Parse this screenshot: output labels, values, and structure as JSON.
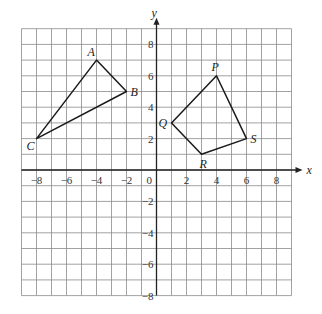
{
  "diagram": {
    "type": "coordinate-grid",
    "axes": {
      "x_label": "x",
      "y_label": "y",
      "x_range": [
        -9,
        9
      ],
      "y_range": [
        -8,
        9
      ],
      "x_ticks": [
        {
          "value": -8,
          "label": "−8"
        },
        {
          "value": -6,
          "label": "−6"
        },
        {
          "value": -4,
          "label": "−4"
        },
        {
          "value": -2,
          "label": "−2"
        },
        {
          "value": 2,
          "label": "2"
        },
        {
          "value": 4,
          "label": "4"
        },
        {
          "value": 6,
          "label": "6"
        },
        {
          "value": 8,
          "label": "8"
        }
      ],
      "y_ticks": [
        {
          "value": 8,
          "label": "8"
        },
        {
          "value": 6,
          "label": "6"
        },
        {
          "value": 4,
          "label": "4"
        },
        {
          "value": 2,
          "label": "2"
        },
        {
          "value": -2,
          "label": "−2"
        },
        {
          "value": -4,
          "label": "−4"
        },
        {
          "value": -6,
          "label": "−6"
        },
        {
          "value": -8,
          "label": "−8"
        }
      ],
      "origin_label": "0"
    },
    "shapes": [
      {
        "name": "triangle-abc",
        "vertices": [
          {
            "label": "A",
            "x": -4,
            "y": 7,
            "label_dx": -9,
            "label_dy": -4
          },
          {
            "label": "B",
            "x": -2,
            "y": 5,
            "label_dx": 4,
            "label_dy": 4
          },
          {
            "label": "C",
            "x": -8,
            "y": 2,
            "label_dx": -10,
            "label_dy": 11
          }
        ]
      },
      {
        "name": "quadrilateral-pqrs",
        "vertices": [
          {
            "label": "P",
            "x": 4,
            "y": 6,
            "label_dx": -5,
            "label_dy": -5
          },
          {
            "label": "S",
            "x": 6,
            "y": 2,
            "label_dx": 4,
            "label_dy": 4
          },
          {
            "label": "R",
            "x": 3,
            "y": 1,
            "label_dx": -2,
            "label_dy": 14
          },
          {
            "label": "Q",
            "x": 1,
            "y": 3,
            "label_dx": -13,
            "label_dy": 4
          }
        ]
      }
    ]
  }
}
